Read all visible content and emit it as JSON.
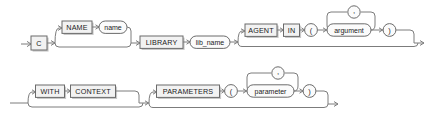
{
  "diagram": {
    "type": "railroad-syntax-diagram",
    "background_color": "#ffffff",
    "line_color": "#7c7c7c",
    "box_fill": "#f2f2f2",
    "box_stroke": "#6b6b6b",
    "oval_fill": "#fbfbfb",
    "text_color": "#1a1a1a",
    "rows": [
      {
        "id": "row-1",
        "nodes": [
          {
            "id": "n-c",
            "label": "C",
            "shape": "box",
            "kind": "keyword",
            "optional": false
          },
          {
            "id": "n-name",
            "label": "NAME",
            "shape": "box",
            "kind": "keyword",
            "optional": true
          },
          {
            "id": "n-namevar",
            "label": "name",
            "shape": "oval",
            "kind": "variable",
            "optional": true
          },
          {
            "id": "n-library",
            "label": "LIBRARY",
            "shape": "box",
            "kind": "keyword",
            "optional": false
          },
          {
            "id": "n-libname",
            "label": "lib_name",
            "shape": "oval",
            "kind": "variable",
            "optional": false
          },
          {
            "id": "n-agent",
            "label": "AGENT",
            "shape": "box",
            "kind": "keyword",
            "optional": true
          },
          {
            "id": "n-in",
            "label": "IN",
            "shape": "box",
            "kind": "keyword",
            "optional": true
          },
          {
            "id": "n-lparen-1",
            "label": "(",
            "shape": "circle",
            "kind": "punct",
            "optional": true
          },
          {
            "id": "n-argument",
            "label": "argument",
            "shape": "oval",
            "kind": "variable",
            "optional": true
          },
          {
            "id": "n-comma-1",
            "label": ",",
            "shape": "circle",
            "kind": "punct",
            "optional": true,
            "loop": true
          },
          {
            "id": "n-rparen-1",
            "label": ")",
            "shape": "circle",
            "kind": "punct",
            "optional": true
          }
        ]
      },
      {
        "id": "row-2",
        "nodes": [
          {
            "id": "n-with",
            "label": "WITH",
            "shape": "box",
            "kind": "keyword",
            "optional": true
          },
          {
            "id": "n-context",
            "label": "CONTEXT",
            "shape": "box",
            "kind": "keyword",
            "optional": true
          },
          {
            "id": "n-parameters",
            "label": "PARAMETERS",
            "shape": "box",
            "kind": "keyword",
            "optional": true
          },
          {
            "id": "n-lparen-2",
            "label": "(",
            "shape": "circle",
            "kind": "punct",
            "optional": true
          },
          {
            "id": "n-parameter",
            "label": "parameter",
            "shape": "oval",
            "kind": "variable",
            "optional": true
          },
          {
            "id": "n-comma-2",
            "label": ",",
            "shape": "circle",
            "kind": "punct",
            "optional": true,
            "loop": true
          },
          {
            "id": "n-rparen-2",
            "label": ")",
            "shape": "circle",
            "kind": "punct",
            "optional": true
          }
        ]
      }
    ]
  }
}
